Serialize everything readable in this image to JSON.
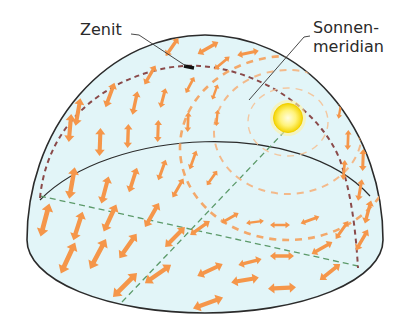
{
  "labels": {
    "zenit": "Zenit",
    "sonnenmeridian_line1": "Sonnen-",
    "sonnenmeridian_line2": "meridian"
  },
  "colors": {
    "dome_fill": "#dff3f7",
    "dome_outline": "#2b2b2b",
    "arrow": "#f5964a",
    "arrow_faint": "#f3b98a",
    "meridian_dash": "#8a4a4a",
    "horizon_axis_dash": "#5c9a6a",
    "sun_core": "#fff6a0",
    "sun_edge": "#f6d800"
  }
}
